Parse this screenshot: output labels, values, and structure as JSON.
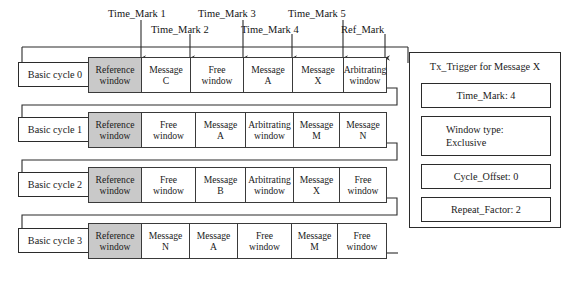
{
  "time_marks": {
    "upper": [
      {
        "label": "Time_Mark 1"
      },
      {
        "label": "Time_Mark 3"
      },
      {
        "label": "Time_Mark 5"
      }
    ],
    "lower": [
      {
        "label": "Time_Mark 2"
      },
      {
        "label": "Time_Mark 4"
      },
      {
        "label": "Ref_Mark"
      }
    ]
  },
  "cycles": [
    {
      "label": "Basic cycle 0",
      "slots": [
        {
          "line1": "Reference",
          "line2": "window",
          "type": "reference"
        },
        {
          "line1": "Message",
          "line2": "C",
          "type": "message"
        },
        {
          "line1": "Free",
          "line2": "window",
          "type": "free"
        },
        {
          "line1": "Message",
          "line2": "A",
          "type": "message"
        },
        {
          "line1": "Message",
          "line2": "X",
          "type": "message"
        },
        {
          "line1": "Arbitrating",
          "line2": "window",
          "type": "arbitrating"
        }
      ]
    },
    {
      "label": "Basic cycle 1",
      "slots": [
        {
          "line1": "Reference",
          "line2": "window",
          "type": "reference"
        },
        {
          "line1": "Free",
          "line2": "window",
          "type": "free"
        },
        {
          "line1": "Message",
          "line2": "A",
          "type": "message"
        },
        {
          "line1": "Arbitrating",
          "line2": "window",
          "type": "arbitrating"
        },
        {
          "line1": "Message",
          "line2": "M",
          "type": "message"
        },
        {
          "line1": "Message",
          "line2": "N",
          "type": "message"
        }
      ]
    },
    {
      "label": "Basic cycle 2",
      "slots": [
        {
          "line1": "Reference",
          "line2": "window",
          "type": "reference"
        },
        {
          "line1": "Free",
          "line2": "window",
          "type": "free"
        },
        {
          "line1": "Message",
          "line2": "B",
          "type": "message"
        },
        {
          "line1": "Arbitrating",
          "line2": "window",
          "type": "arbitrating"
        },
        {
          "line1": "Message",
          "line2": "X",
          "type": "message"
        },
        {
          "line1": "Free",
          "line2": "window",
          "type": "free"
        }
      ]
    },
    {
      "label": "Basic cycle 3",
      "slots": [
        {
          "line1": "Reference",
          "line2": "window",
          "type": "reference"
        },
        {
          "line1": "Message",
          "line2": "N",
          "type": "message"
        },
        {
          "line1": "Message",
          "line2": "A",
          "type": "message"
        },
        {
          "line1": "Free",
          "line2": "window",
          "type": "free"
        },
        {
          "line1": "Message",
          "line2": "M",
          "type": "message"
        },
        {
          "line1": "Free",
          "line2": "window",
          "type": "free"
        }
      ]
    }
  ],
  "panel": {
    "title": "Tx_Trigger for Message X",
    "fields": [
      {
        "line1": "Time_Mark: 4",
        "line2": ""
      },
      {
        "line1": "Window type:",
        "line2": "Exclusive"
      },
      {
        "line1": "Cycle_Offset: 0",
        "line2": ""
      },
      {
        "line1": "Repeat_Factor: 2",
        "line2": ""
      }
    ]
  },
  "colors": {
    "reference_fill": "#c9c9c9",
    "stroke": "#3a3a3a",
    "background": "#ffffff"
  }
}
